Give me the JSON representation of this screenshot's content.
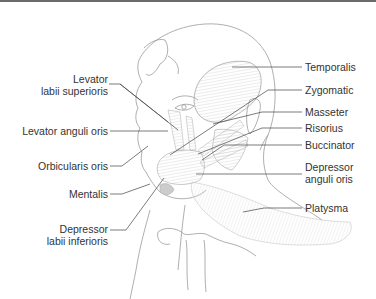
{
  "diagram": {
    "colors": {
      "line": "#555555",
      "outline": "#9a9a9a",
      "muscle": "#c8c8c8",
      "text": "#333333",
      "topbar": "#6b6b6b"
    },
    "labels_left": [
      {
        "id": "levator-labii-superioris",
        "line1": "Levator",
        "line2": "labii superioris"
      },
      {
        "id": "levator-anguli-oris",
        "line1": "Levator anguli oris"
      },
      {
        "id": "orbicularis-oris",
        "line1": "Orbicularis oris"
      },
      {
        "id": "mentalis",
        "line1": "Mentalis"
      },
      {
        "id": "depressor-labii-inferioris",
        "line1": "Depressor",
        "line2": "labii inferioris"
      }
    ],
    "labels_right": [
      {
        "id": "temporalis",
        "line1": "Temporalis"
      },
      {
        "id": "zygomatic",
        "line1": "Zygomatic"
      },
      {
        "id": "masseter",
        "line1": "Masseter"
      },
      {
        "id": "risorius",
        "line1": "Risorius"
      },
      {
        "id": "buccinator",
        "line1": "Buccinator"
      },
      {
        "id": "depressor-anguli-oris",
        "line1": "Depressor",
        "line2": "anguli oris"
      },
      {
        "id": "platysma",
        "line1": "Platysma"
      }
    ]
  }
}
